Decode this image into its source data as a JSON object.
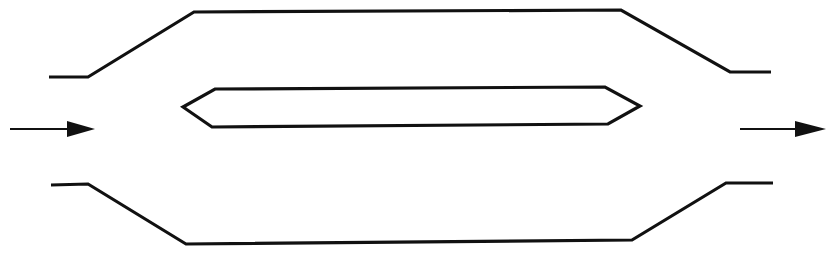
{
  "diagram": {
    "type": "flow-splitter-schematic",
    "colors": {
      "stroke": "#111111",
      "background": "#ffffff"
    },
    "elements": {
      "outer_top_wall": {
        "points": [
          [
            49,
            77
          ],
          [
            88,
            77
          ],
          [
            194,
            12
          ],
          [
            621,
            10
          ],
          [
            730,
            72
          ],
          [
            771,
            72
          ]
        ]
      },
      "outer_bottom_wall": {
        "points": [
          [
            51,
            185
          ],
          [
            88,
            184
          ],
          [
            186,
            244
          ],
          [
            632,
            240
          ],
          [
            726,
            183
          ],
          [
            773,
            183
          ]
        ]
      },
      "central_body": {
        "shape": "elongated-hexagon",
        "points": [
          [
            215,
            89
          ],
          [
            605,
            87
          ],
          [
            640,
            106
          ],
          [
            608,
            124
          ],
          [
            212,
            127
          ],
          [
            183,
            107
          ]
        ]
      },
      "inlet_arrow": {
        "direction": "right",
        "from": [
          10,
          129
        ],
        "to": [
          95,
          129
        ]
      },
      "outlet_arrow": {
        "direction": "right",
        "from": [
          740,
          129
        ],
        "to": [
          826,
          129
        ]
      }
    },
    "labels": []
  }
}
